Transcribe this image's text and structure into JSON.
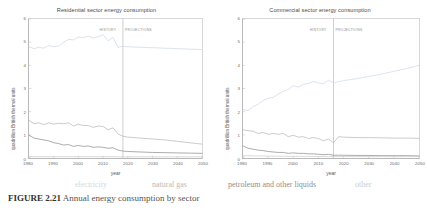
{
  "figure": {
    "caption_number": "FIGURE 2.21",
    "caption_text": "   Annual energy consumption by sector"
  },
  "legend": {
    "position": "bottom",
    "items": [
      {
        "label": "electricity",
        "color": "#cfd9e6"
      },
      {
        "label": "natural gas",
        "color": "#b9b9b9"
      },
      {
        "label": "petroleum and other liquids",
        "color": "#8f8f8f"
      },
      {
        "label": "other",
        "color": "#cccccc"
      }
    ]
  },
  "panels": [
    {
      "id": "residential",
      "title": "Residential sector energy consumption",
      "xlabel": "year",
      "ylabel": "quadrillion British thermal units",
      "history_label": "HISTORY",
      "projections_label": "PROJECTIONS",
      "divider_year": 2018,
      "xticks": [
        "1980",
        "1990",
        "2000",
        "2010",
        "2020",
        "2030",
        "2040",
        "2050"
      ],
      "yticks": [
        "0",
        "1",
        "2",
        "3",
        "4",
        "5",
        "6"
      ]
    },
    {
      "id": "commercial",
      "title": "Commercial sector energy consumption",
      "xlabel": "year",
      "ylabel": "quadrillion British thermal units",
      "history_label": "HISTORY",
      "projections_label": "PROJECTIONS",
      "divider_year": 2016,
      "xticks": [
        "1980",
        "1990",
        "2000",
        "2010",
        "2020",
        "2030",
        "2040",
        "2050"
      ],
      "yticks": [
        "0",
        "1",
        "2",
        "3",
        "4",
        "5",
        "6"
      ]
    }
  ],
  "chart_data": [
    {
      "type": "line",
      "id": "residential",
      "title": "Residential sector energy consumption",
      "xlabel": "year",
      "ylabel": "quadrillion British thermal units",
      "xlim": [
        1980,
        2050
      ],
      "ylim": [
        0,
        6
      ],
      "grid": false,
      "legend_position": "bottom",
      "annotations": [
        {
          "text": "HISTORY",
          "x": 2010
        },
        {
          "text": "PROJECTIONS",
          "x": 2026
        },
        {
          "text": "history-projection divider",
          "x": 2018
        }
      ],
      "x": [
        1980,
        1982,
        1984,
        1986,
        1988,
        1990,
        1992,
        1994,
        1996,
        1998,
        2000,
        2002,
        2004,
        2006,
        2008,
        2010,
        2012,
        2014,
        2016,
        2018,
        2020,
        2025,
        2030,
        2035,
        2040,
        2045,
        2050
      ],
      "series": [
        {
          "name": "electricity",
          "color": "#cfd9e6",
          "values": [
            4.8,
            4.72,
            4.78,
            4.74,
            4.86,
            4.8,
            4.84,
            5.0,
            5.12,
            5.1,
            5.22,
            5.2,
            5.26,
            5.18,
            5.24,
            5.32,
            5.06,
            5.2,
            4.78,
            4.82,
            4.8,
            4.78,
            4.76,
            4.74,
            4.72,
            4.7,
            4.68
          ]
        },
        {
          "name": "natural gas",
          "color": "#b9b9b9",
          "values": [
            1.62,
            1.48,
            1.52,
            1.44,
            1.52,
            1.46,
            1.5,
            1.48,
            1.52,
            1.38,
            1.46,
            1.4,
            1.4,
            1.32,
            1.38,
            1.36,
            1.22,
            1.3,
            1.04,
            0.94,
            0.9,
            0.86,
            0.82,
            0.78,
            0.72,
            0.66,
            0.6
          ]
        },
        {
          "name": "petroleum and other liquids",
          "color": "#8f8f8f",
          "values": [
            0.98,
            0.86,
            0.82,
            0.78,
            0.74,
            0.66,
            0.62,
            0.56,
            0.58,
            0.5,
            0.54,
            0.5,
            0.52,
            0.46,
            0.48,
            0.46,
            0.42,
            0.44,
            0.34,
            0.3,
            0.28,
            0.26,
            0.24,
            0.23,
            0.22,
            0.21,
            0.2
          ]
        },
        {
          "name": "other",
          "color": "#cccccc",
          "values": [
            0.06,
            0.06,
            0.06,
            0.06,
            0.06,
            0.06,
            0.06,
            0.06,
            0.06,
            0.06,
            0.06,
            0.06,
            0.06,
            0.06,
            0.06,
            0.06,
            0.06,
            0.06,
            0.05,
            0.05,
            0.05,
            0.05,
            0.05,
            0.05,
            0.05,
            0.05,
            0.05
          ]
        }
      ]
    },
    {
      "type": "line",
      "id": "commercial",
      "title": "Commercial sector energy consumption",
      "xlabel": "year",
      "ylabel": "quadrillion British thermal units",
      "xlim": [
        1980,
        2050
      ],
      "ylim": [
        0,
        6
      ],
      "grid": false,
      "legend_position": "bottom",
      "annotations": [
        {
          "text": "HISTORY",
          "x": 2008
        },
        {
          "text": "PROJECTIONS",
          "x": 2024
        },
        {
          "text": "history-projection divider",
          "x": 2016
        }
      ],
      "x": [
        1980,
        1982,
        1984,
        1986,
        1988,
        1990,
        1992,
        1994,
        1996,
        1998,
        2000,
        2002,
        2004,
        2006,
        2008,
        2010,
        2012,
        2014,
        2016,
        2018,
        2020,
        2025,
        2030,
        2035,
        2040,
        2045,
        2050
      ],
      "series": [
        {
          "name": "electricity",
          "color": "#cfd9e6",
          "values": [
            2.1,
            2.04,
            2.22,
            2.32,
            2.48,
            2.58,
            2.62,
            2.76,
            2.88,
            2.96,
            3.12,
            3.06,
            3.18,
            3.22,
            3.3,
            3.24,
            3.2,
            3.36,
            3.24,
            3.3,
            3.34,
            3.42,
            3.52,
            3.62,
            3.74,
            3.86,
            4.0
          ]
        },
        {
          "name": "natural gas",
          "color": "#b9b9b9",
          "values": [
            1.22,
            1.18,
            1.16,
            1.06,
            1.1,
            1.02,
            1.06,
            1.02,
            1.06,
            0.92,
            0.98,
            0.9,
            0.92,
            0.84,
            0.88,
            0.84,
            0.74,
            0.82,
            0.66,
            0.92,
            0.9,
            0.88,
            0.88,
            0.87,
            0.86,
            0.86,
            0.85
          ]
        },
        {
          "name": "petroleum and other liquids",
          "color": "#8f8f8f",
          "values": [
            0.52,
            0.42,
            0.38,
            0.34,
            0.32,
            0.28,
            0.26,
            0.24,
            0.24,
            0.2,
            0.22,
            0.2,
            0.2,
            0.18,
            0.18,
            0.16,
            0.14,
            0.16,
            0.12,
            0.12,
            0.12,
            0.11,
            0.11,
            0.1,
            0.1,
            0.1,
            0.09
          ]
        },
        {
          "name": "other",
          "color": "#cccccc",
          "values": [
            0.1,
            0.1,
            0.09,
            0.09,
            0.09,
            0.08,
            0.08,
            0.08,
            0.08,
            0.07,
            0.07,
            0.07,
            0.07,
            0.07,
            0.07,
            0.06,
            0.06,
            0.06,
            0.06,
            0.06,
            0.06,
            0.06,
            0.06,
            0.06,
            0.06,
            0.06,
            0.06
          ]
        }
      ]
    }
  ]
}
